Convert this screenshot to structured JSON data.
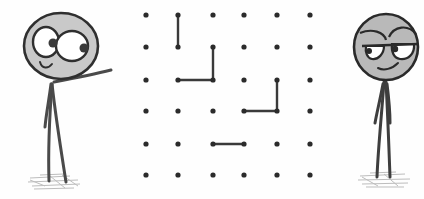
{
  "scene": {
    "description": "Hand-drawn dots-and-boxes game between two stick figures",
    "colors": {
      "ink": "#2f2f2f",
      "dot": "#2b2b2b",
      "line": "#3a3a3a",
      "head_fill": "#c9c9c9",
      "eye_fill": "#ffffff",
      "ground": "#bdbdbd",
      "background": "#ffffff"
    }
  },
  "board": {
    "columns": [
      146,
      178,
      213,
      244,
      277,
      310
    ],
    "rows": [
      15,
      47,
      80,
      111,
      144,
      175
    ],
    "dot_radius": 2.6,
    "lines": [
      {
        "from": [
          1,
          0
        ],
        "to": [
          1,
          1
        ]
      },
      {
        "from": [
          2,
          1
        ],
        "to": [
          2,
          2
        ]
      },
      {
        "from": [
          1,
          2
        ],
        "to": [
          2,
          2
        ]
      },
      {
        "from": [
          4,
          2
        ],
        "to": [
          4,
          3
        ]
      },
      {
        "from": [
          3,
          3
        ],
        "to": [
          4,
          3
        ]
      },
      {
        "from": [
          2,
          4
        ],
        "to": [
          3,
          4
        ]
      }
    ]
  },
  "players": [
    {
      "name": "left-stick-figure",
      "pose": "pointing at board",
      "expression": "smiling, wide eyes"
    },
    {
      "name": "right-stick-figure",
      "pose": "standing",
      "expression": "half-lidded smirk"
    }
  ]
}
